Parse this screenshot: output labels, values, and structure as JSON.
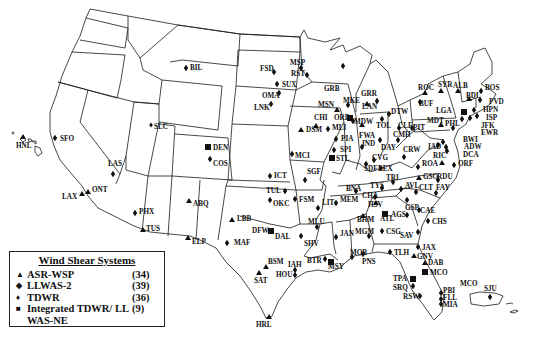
{
  "legend": {
    "title": "Wind Shear Systems",
    "items": [
      {
        "symbol": "triangle",
        "glyph": "▲",
        "name": "ASR-WSP",
        "count": "(34)"
      },
      {
        "symbol": "diamond",
        "glyph": "◆",
        "name": "LLWAS-2",
        "count": "(39)"
      },
      {
        "symbol": "dot",
        "glyph": "♦",
        "name": "TDWR",
        "count": "(36)"
      },
      {
        "symbol": "square",
        "glyph": "■",
        "name": "Integrated TDWR/ LL WAS-NE",
        "count": "(9)"
      }
    ]
  },
  "sites": [
    {
      "code": "BIL",
      "type": "diamond",
      "x": 186,
      "y": 68,
      "lx": 190,
      "ly": 70
    },
    {
      "code": "SFO",
      "type": "diamond",
      "x": 55,
      "y": 138,
      "lx": 60,
      "ly": 141
    },
    {
      "code": "HNL",
      "type": "triangle",
      "x": 23,
      "y": 137,
      "lx": 16,
      "ly": 148
    },
    {
      "code": "SLC",
      "type": "dot",
      "x": 151,
      "y": 125,
      "lx": 154,
      "ly": 129
    },
    {
      "code": "LAS",
      "type": "diamond",
      "x": 113,
      "y": 174,
      "lx": 108,
      "ly": 166
    },
    {
      "code": "LAX",
      "type": "triangle",
      "x": 82,
      "y": 194,
      "lx": 62,
      "ly": 199
    },
    {
      "code": "ONT",
      "type": "triangle",
      "x": 88,
      "y": 192,
      "lx": 92,
      "ly": 192
    },
    {
      "code": "PHX",
      "type": "diamond",
      "x": 135,
      "y": 213,
      "lx": 139,
      "ly": 214
    },
    {
      "code": "TUS",
      "type": "triangle",
      "x": 143,
      "y": 230,
      "lx": 146,
      "ly": 231
    },
    {
      "code": "DEN",
      "type": "square",
      "x": 208,
      "y": 147,
      "lx": 213,
      "ly": 150
    },
    {
      "code": "COS",
      "type": "diamond",
      "x": 210,
      "y": 159,
      "lx": 213,
      "ly": 166
    },
    {
      "code": "ABQ",
      "type": "triangle",
      "x": 189,
      "y": 201,
      "lx": 193,
      "ly": 206
    },
    {
      "code": "ELP",
      "type": "triangle",
      "x": 188,
      "y": 238,
      "lx": 192,
      "ly": 244
    },
    {
      "code": "LBB",
      "type": "triangle",
      "x": 232,
      "y": 220,
      "lx": 237,
      "ly": 221
    },
    {
      "code": "MAF",
      "type": "diamond",
      "x": 227,
      "y": 243,
      "lx": 234,
      "ly": 245
    },
    {
      "code": "DFW",
      "type": "square",
      "x": 271,
      "y": 231,
      "lx": 252,
      "ly": 233
    },
    {
      "code": "DAL",
      "type": "label",
      "x": 0,
      "y": 0,
      "lx": 275,
      "ly": 239
    },
    {
      "code": "BSM",
      "type": "triangle",
      "x": 266,
      "y": 267,
      "lx": 268,
      "ly": 264
    },
    {
      "code": "SAT",
      "type": "triangle",
      "x": 259,
      "y": 273,
      "lx": 254,
      "ly": 283
    },
    {
      "code": "IAH",
      "type": "diamond",
      "x": 295,
      "y": 270,
      "lx": 288,
      "ly": 267
    },
    {
      "code": "HOU",
      "type": "diamond",
      "x": 295,
      "y": 275,
      "lx": 276,
      "ly": 277
    },
    {
      "code": "HRL",
      "type": "triangle",
      "x": 269,
      "y": 317,
      "lx": 256,
      "ly": 327
    },
    {
      "code": "FSD",
      "type": "diamond",
      "x": 274,
      "y": 72,
      "lx": 260,
      "ly": 71
    },
    {
      "code": "SUX",
      "type": "diamond",
      "x": 277,
      "y": 84,
      "lx": 282,
      "ly": 87
    },
    {
      "code": "OMA",
      "type": "diamond",
      "x": 279,
      "y": 93,
      "lx": 262,
      "ly": 98
    },
    {
      "code": "LNK",
      "type": "diamond",
      "x": 271,
      "y": 104,
      "lx": 254,
      "ly": 110
    },
    {
      "code": "MSP",
      "type": "diamond",
      "x": 301,
      "y": 68,
      "lx": 290,
      "ly": 65
    },
    {
      "code": "RST",
      "type": "diamond",
      "x": 307,
      "y": 75,
      "lx": 291,
      "ly": 76
    },
    {
      "code": "GRB",
      "type": "diamond",
      "x": 343,
      "y": 66,
      "lx": 324,
      "ly": 91
    },
    {
      "code": "MSN",
      "type": "triangle",
      "x": 337,
      "y": 110,
      "lx": 318,
      "ly": 107
    },
    {
      "code": "MKE",
      "type": "diamond",
      "x": 348,
      "y": 105,
      "lx": 343,
      "ly": 103
    },
    {
      "code": "CHI",
      "type": "triangle",
      "x": 316,
      "y": 126,
      "lx": 314,
      "ly": 120
    },
    {
      "code": "ORD",
      "type": "square",
      "x": 350,
      "y": 118,
      "lx": 334,
      "ly": 120
    },
    {
      "code": "MDW",
      "type": "diamond",
      "x": 353,
      "y": 121,
      "lx": 354,
      "ly": 124
    },
    {
      "code": "DSM",
      "type": "triangle",
      "x": 301,
      "y": 130,
      "lx": 306,
      "ly": 132
    },
    {
      "code": "MLI",
      "type": "diamond",
      "x": 328,
      "y": 129,
      "lx": 332,
      "ly": 130
    },
    {
      "code": "PIA",
      "type": "diamond",
      "x": 336,
      "y": 139,
      "lx": 341,
      "ly": 141
    },
    {
      "code": "SPI",
      "type": "diamond",
      "x": 334,
      "y": 150,
      "lx": 340,
      "ly": 152
    },
    {
      "code": "STL",
      "type": "square",
      "x": 332,
      "y": 158,
      "lx": 336,
      "ly": 161
    },
    {
      "code": "MCI",
      "type": "diamond",
      "x": 292,
      "y": 154,
      "lx": 295,
      "ly": 158
    },
    {
      "code": "SGF",
      "type": "diamond",
      "x": 305,
      "y": 180,
      "lx": 307,
      "ly": 174
    },
    {
      "code": "ICT",
      "type": "diamond",
      "x": 270,
      "y": 176,
      "lx": 274,
      "ly": 178
    },
    {
      "code": "TUL",
      "type": "diamond",
      "x": 285,
      "y": 191,
      "lx": 266,
      "ly": 193
    },
    {
      "code": "OKC",
      "type": "diamond",
      "x": 270,
      "y": 200,
      "lx": 273,
      "ly": 206
    },
    {
      "code": "FSM",
      "type": "diamond",
      "x": 295,
      "y": 199,
      "lx": 299,
      "ly": 202
    },
    {
      "code": "LIT",
      "type": "diamond",
      "x": 318,
      "y": 208,
      "lx": 322,
      "ly": 205
    },
    {
      "code": "MEM",
      "type": "diamond",
      "x": 336,
      "y": 203,
      "lx": 340,
      "ly": 202
    },
    {
      "code": "BNA",
      "type": "diamond",
      "x": 356,
      "y": 191,
      "lx": 346,
      "ly": 191
    },
    {
      "code": "MLU",
      "type": "diamond",
      "x": 317,
      "y": 227,
      "lx": 308,
      "ly": 224
    },
    {
      "code": "SHV",
      "type": "diamond",
      "x": 301,
      "y": 236,
      "lx": 304,
      "ly": 246
    },
    {
      "code": "JAN",
      "type": "diamond",
      "x": 336,
      "y": 237,
      "lx": 340,
      "ly": 236
    },
    {
      "code": "BTR",
      "type": "diamond",
      "x": 325,
      "y": 259,
      "lx": 307,
      "ly": 263
    },
    {
      "code": "MSY",
      "type": "square",
      "x": 331,
      "y": 262,
      "lx": 328,
      "ly": 269
    },
    {
      "code": "MOB",
      "type": "diamond",
      "x": 352,
      "y": 257,
      "lx": 350,
      "ly": 255
    },
    {
      "code": "BHM",
      "type": "triangle",
      "x": 363,
      "y": 216,
      "lx": 357,
      "ly": 222
    },
    {
      "code": "MGM",
      "type": "diamond",
      "x": 369,
      "y": 236,
      "lx": 355,
      "ly": 234
    },
    {
      "code": "HSV",
      "type": "triangle",
      "x": 376,
      "y": 203,
      "lx": 368,
      "ly": 207
    },
    {
      "code": "ATL",
      "type": "square",
      "x": 385,
      "y": 214,
      "lx": 380,
      "ly": 221
    },
    {
      "code": "AGS",
      "type": "diamond",
      "x": 407,
      "y": 215,
      "lx": 391,
      "ly": 217
    },
    {
      "code": "CSG",
      "type": "diamond",
      "x": 382,
      "y": 231,
      "lx": 386,
      "ly": 234
    },
    {
      "code": "SAV",
      "type": "diamond",
      "x": 418,
      "y": 232,
      "lx": 400,
      "ly": 238
    },
    {
      "code": "CHS",
      "type": "diamond",
      "x": 428,
      "y": 221,
      "lx": 432,
      "ly": 224
    },
    {
      "code": "PNS",
      "type": "diamond",
      "x": 363,
      "y": 254,
      "lx": 362,
      "ly": 264
    },
    {
      "code": "TLH",
      "type": "diamond",
      "x": 390,
      "y": 252,
      "lx": 394,
      "ly": 255
    },
    {
      "code": "JAX",
      "type": "diamond",
      "x": 418,
      "y": 247,
      "lx": 422,
      "ly": 250
    },
    {
      "code": "GNV",
      "type": "triangle",
      "x": 414,
      "y": 256,
      "lx": 417,
      "ly": 259
    },
    {
      "code": "DAB",
      "type": "triangle",
      "x": 425,
      "y": 263,
      "lx": 428,
      "ly": 265
    },
    {
      "code": "MCO",
      "type": "square",
      "x": 425,
      "y": 272,
      "lx": 430,
      "ly": 275
    },
    {
      "code": "TPA",
      "type": "square",
      "x": 413,
      "y": 279,
      "lx": 393,
      "ly": 281
    },
    {
      "code": "SRQ",
      "type": "diamond",
      "x": 413,
      "y": 286,
      "lx": 393,
      "ly": 290
    },
    {
      "code": "RSW",
      "type": "diamond",
      "x": 420,
      "y": 296,
      "lx": 403,
      "ly": 299
    },
    {
      "code": "PBI",
      "type": "diamond",
      "x": 441,
      "y": 293,
      "lx": 443,
      "ly": 293
    },
    {
      "code": "FLL",
      "type": "diamond",
      "x": 441,
      "y": 299,
      "lx": 443,
      "ly": 300
    },
    {
      "code": "MIA",
      "type": "diamond",
      "x": 441,
      "y": 304,
      "lx": 443,
      "ly": 307
    },
    {
      "code": "MCO",
      "type": "label",
      "x": 0,
      "y": 0,
      "lx": 460,
      "ly": 286
    },
    {
      "code": "SJU",
      "type": "diamond",
      "x": 490,
      "y": 297,
      "lx": 484,
      "ly": 291
    },
    {
      "code": "GRR",
      "type": "triangle",
      "x": 367,
      "y": 104,
      "lx": 361,
      "ly": 96
    },
    {
      "code": "LAN",
      "type": "diamond",
      "x": 377,
      "y": 101,
      "lx": 362,
      "ly": 109
    },
    {
      "code": "DTW",
      "type": "diamond",
      "x": 389,
      "y": 114,
      "lx": 391,
      "ly": 114
    },
    {
      "code": "TOL",
      "type": "diamond",
      "x": 382,
      "y": 119,
      "lx": 376,
      "ly": 128
    },
    {
      "code": "FWA",
      "type": "triangle",
      "x": 362,
      "y": 125,
      "lx": 359,
      "ly": 138
    },
    {
      "code": "IND",
      "type": "diamond",
      "x": 362,
      "y": 147,
      "lx": 362,
      "ly": 146
    },
    {
      "code": "DAY",
      "type": "diamond",
      "x": 380,
      "y": 140,
      "lx": 381,
      "ly": 150
    },
    {
      "code": "CLE",
      "type": "diamond",
      "x": 399,
      "y": 128,
      "lx": 398,
      "ly": 128
    },
    {
      "code": "CMH",
      "type": "diamond",
      "x": 398,
      "y": 140,
      "lx": 393,
      "ly": 137
    },
    {
      "code": "PIT",
      "type": "diamond",
      "x": 412,
      "y": 128,
      "lx": 413,
      "ly": 130
    },
    {
      "code": "CVG",
      "type": "diamond",
      "x": 374,
      "y": 160,
      "lx": 372,
      "ly": 160
    },
    {
      "code": "SDF",
      "type": "diamond",
      "x": 366,
      "y": 164,
      "lx": 364,
      "ly": 171
    },
    {
      "code": "LEX",
      "type": "diamond",
      "x": 381,
      "y": 168,
      "lx": 378,
      "ly": 171
    },
    {
      "code": "CRW",
      "type": "diamond",
      "x": 404,
      "y": 157,
      "lx": 403,
      "ly": 152
    },
    {
      "code": "ROA",
      "type": "diamond",
      "x": 418,
      "y": 167,
      "lx": 422,
      "ly": 166
    },
    {
      "code": "RIC",
      "type": "triangle",
      "x": 442,
      "y": 163,
      "lx": 433,
      "ly": 158
    },
    {
      "code": "ORF",
      "type": "diamond",
      "x": 454,
      "y": 165,
      "lx": 458,
      "ly": 166
    },
    {
      "code": "TRI",
      "type": "diamond",
      "x": 393,
      "y": 182,
      "lx": 386,
      "ly": 180
    },
    {
      "code": "TYS",
      "type": "diamond",
      "x": 382,
      "y": 188,
      "lx": 370,
      "ly": 188
    },
    {
      "code": "CHA",
      "type": "diamond",
      "x": 375,
      "y": 197,
      "lx": 362,
      "ly": 198
    },
    {
      "code": "AVL",
      "type": "diamond",
      "x": 401,
      "y": 189,
      "lx": 405,
      "ly": 188
    },
    {
      "code": "GSO",
      "type": "triangle",
      "x": 419,
      "y": 178,
      "lx": 423,
      "ly": 179
    },
    {
      "code": "RDU",
      "type": "diamond",
      "x": 438,
      "y": 180,
      "lx": 437,
      "ly": 179
    },
    {
      "code": "CLT",
      "type": "diamond",
      "x": 416,
      "y": 192,
      "lx": 419,
      "ly": 190
    },
    {
      "code": "FAY",
      "type": "diamond",
      "x": 436,
      "y": 193,
      "lx": 436,
      "ly": 190
    },
    {
      "code": "GSP",
      "type": "diamond",
      "x": 407,
      "y": 200,
      "lx": 405,
      "ly": 210
    },
    {
      "code": "CAE",
      "type": "diamond",
      "x": 419,
      "y": 210,
      "lx": 420,
      "ly": 213
    },
    {
      "code": "ROC",
      "type": "triangle",
      "x": 425,
      "y": 93,
      "lx": 418,
      "ly": 90
    },
    {
      "code": "SYR",
      "type": "triangle",
      "x": 441,
      "y": 91,
      "lx": 438,
      "ly": 87
    },
    {
      "code": "ALB",
      "type": "triangle",
      "x": 458,
      "y": 91,
      "lx": 453,
      "ly": 88
    },
    {
      "code": "BDL",
      "type": "triangle",
      "x": 469,
      "y": 99,
      "lx": 466,
      "ly": 98
    },
    {
      "code": "BOS",
      "type": "diamond",
      "x": 481,
      "y": 91,
      "lx": 485,
      "ly": 90
    },
    {
      "code": "PVD",
      "type": "diamond",
      "x": 480,
      "y": 100,
      "lx": 489,
      "ly": 104
    },
    {
      "code": "BUF",
      "type": "diamond",
      "x": 420,
      "y": 102,
      "lx": 419,
      "ly": 106
    },
    {
      "code": "HPN",
      "type": "diamond",
      "x": 474,
      "y": 110,
      "lx": 483,
      "ly": 112
    },
    {
      "code": "ISP",
      "type": "diamond",
      "x": 477,
      "y": 116,
      "lx": 486,
      "ly": 120
    },
    {
      "code": "LGA",
      "type": "square",
      "x": 464,
      "y": 112,
      "lx": 436,
      "ly": 113
    },
    {
      "code": "JFK",
      "type": "diamond",
      "x": 470,
      "y": 118,
      "lx": 481,
      "ly": 128
    },
    {
      "code": "EWR",
      "type": "diamond",
      "x": 462,
      "y": 119,
      "lx": 481,
      "ly": 135
    },
    {
      "code": "MDT",
      "type": "triangle",
      "x": 441,
      "y": 125,
      "lx": 427,
      "ly": 123
    },
    {
      "code": "PHL",
      "type": "diamond",
      "x": 453,
      "y": 128,
      "lx": 445,
      "ly": 126
    },
    {
      "code": "BWI",
      "type": "diamond",
      "x": 443,
      "y": 142,
      "lx": 463,
      "ly": 142
    },
    {
      "code": "IAD",
      "type": "diamond",
      "x": 438,
      "y": 145,
      "lx": 428,
      "ly": 149
    },
    {
      "code": "ADW",
      "type": "diamond",
      "x": 446,
      "y": 147,
      "lx": 464,
      "ly": 149
    },
    {
      "code": "DCA",
      "type": "diamond",
      "x": 447,
      "y": 151,
      "lx": 463,
      "ly": 157
    }
  ]
}
